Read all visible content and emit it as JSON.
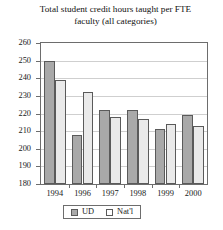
{
  "chart_data": {
    "type": "bar",
    "title": "Total student credit hours taught per FTE faculty (all categories)",
    "title_line1": "Total student credit hours taught per FTE",
    "title_line2": "faculty (all categories)",
    "xlabel": "",
    "ylabel": "",
    "categories": [
      "1994",
      "1996",
      "1997",
      "1998",
      "1999",
      "2000"
    ],
    "series": [
      {
        "name": "UD",
        "color": "#a9a9a9",
        "values": [
          250,
          208,
          222,
          222,
          211,
          219
        ]
      },
      {
        "name": "Nat'l",
        "color": "#eaeaea",
        "values": [
          239,
          232,
          218,
          217,
          214,
          213
        ]
      }
    ],
    "ylim": [
      180,
      260
    ],
    "ytick_labels": [
      "260",
      "250",
      "240",
      "230",
      "220",
      "210",
      "200",
      "190",
      "180"
    ],
    "ytick_values": [
      260,
      250,
      240,
      230,
      220,
      210,
      200,
      190,
      180
    ],
    "grid": true,
    "legend_position": "bottom"
  },
  "legend": {
    "entries": [
      {
        "label": "UD",
        "swatch": "ud"
      },
      {
        "label": "Nat'l",
        "swatch": "natl"
      }
    ]
  }
}
